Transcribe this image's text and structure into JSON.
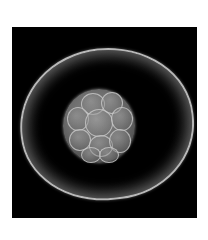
{
  "image": {
    "subject": "embryo micrograph (morula within zona pellucida)",
    "background_color": "#ffffff",
    "frame_color": "#000000",
    "zona_color": "#b8b8b8",
    "cell_color": "#6e6e6e"
  }
}
